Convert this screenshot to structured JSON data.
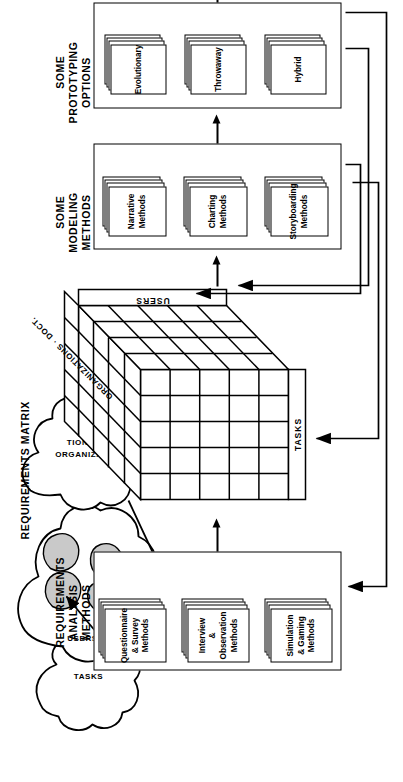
{
  "diagram": {
    "orientation": "rotated-90-ccw",
    "groups": [
      {
        "id": "prototyping",
        "title": "SOME\nPROTOTYPING\nOPTIONS",
        "cards": [
          "Evolutionary",
          "Throwaway",
          "Hybrid"
        ]
      },
      {
        "id": "modeling",
        "title": "SOME\nMODELING\nMETHODS",
        "cards": [
          "Narrative\nMethods",
          "Charting\nMethods",
          "Storyboarding\nMethods"
        ]
      },
      {
        "id": "matrix",
        "title": "REQUIREMENTS MATRIX",
        "axes": {
          "front": "TASKS",
          "side": "USERS",
          "top": "ORGANIZATIONS · DOCT."
        },
        "grid": {
          "columns": 5,
          "rows": 5,
          "depth": 4
        }
      },
      {
        "id": "analysis",
        "title": "REQUIREMENTS\nANALYSIS\nMETHODS",
        "cards": [
          "Questionnaire\n& Survey\nMethods",
          "Interview\n& Observation\nMethods",
          "Simulation\n& Gaming\nMethods"
        ]
      }
    ],
    "sources": [
      {
        "id": "tasks",
        "label": "TASKS"
      },
      {
        "id": "users",
        "label": "USERS"
      },
      {
        "id": "organizations",
        "label": "ORGANIZA-\nTIONS"
      }
    ],
    "colors": {
      "ink": "#000000",
      "paper": "#ffffff",
      "shade": "#c9c9c9"
    }
  }
}
